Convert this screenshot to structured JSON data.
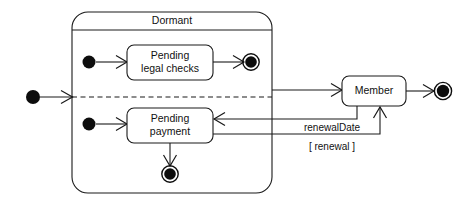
{
  "diagram": {
    "type": "uml-state-machine",
    "title": "",
    "colors": {
      "stroke": "#1a1a1a",
      "node": "#0d0d0d",
      "background": "#ffffff",
      "text": "#111111"
    },
    "composite_state": {
      "name": "Dormant",
      "regions": 2,
      "divider": "dashed-horizontal"
    },
    "states": [
      {
        "id": "pending-legal-checks",
        "line1": "Pending",
        "line2": "legal checks"
      },
      {
        "id": "pending-payment",
        "line1": "Pending",
        "line2": "payment"
      },
      {
        "id": "member",
        "line1": "Member",
        "line2": ""
      }
    ],
    "pseudostates": [
      {
        "id": "initial-outer",
        "kind": "initial"
      },
      {
        "id": "initial-region-top",
        "kind": "initial"
      },
      {
        "id": "initial-region-bottom",
        "kind": "initial"
      },
      {
        "id": "final-region-top",
        "kind": "final"
      },
      {
        "id": "final-region-bottom",
        "kind": "final"
      },
      {
        "id": "final-outer",
        "kind": "final"
      }
    ],
    "transitions": [
      {
        "id": "t-entry",
        "from": "initial-outer",
        "to": "Dormant",
        "label": ""
      },
      {
        "id": "t-init-legal",
        "from": "initial-region-top",
        "to": "pending-legal-checks",
        "label": ""
      },
      {
        "id": "t-legal-final",
        "from": "pending-legal-checks",
        "to": "final-region-top",
        "label": ""
      },
      {
        "id": "t-init-payment",
        "from": "initial-region-bottom",
        "to": "pending-payment",
        "label": ""
      },
      {
        "id": "t-payment-final",
        "from": "pending-payment",
        "to": "final-region-bottom",
        "label": ""
      },
      {
        "id": "t-dormant-member",
        "from": "Dormant",
        "to": "member",
        "label": ""
      },
      {
        "id": "t-member-final",
        "from": "member",
        "to": "final-outer",
        "label": ""
      },
      {
        "id": "t-member-payment",
        "from": "member",
        "to": "pending-payment",
        "label": "renewalDate"
      },
      {
        "id": "t-payment-member",
        "from": "pending-payment",
        "to": "member",
        "label": "[ renewal ]"
      }
    ],
    "labels": {
      "renewal_date": "renewalDate",
      "renewal_guard": "[ renewal ]"
    }
  }
}
